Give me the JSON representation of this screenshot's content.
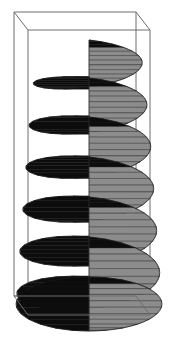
{
  "figure": {
    "title": "Conical helicoid spiral surface in wireframe bounding box",
    "background_color": "#ffffff",
    "width": 176,
    "height": 362,
    "has_text_labels": false,
    "has_axis_tick_labels": false,
    "has_legend": false
  },
  "chart_data": {
    "type": "line",
    "title": "Conical helicoid spiral surface",
    "subtitle": "",
    "xlabel": "",
    "ylabel": "",
    "zlabel": "",
    "plot_style": "3d-surface-mesh",
    "grid": false,
    "legend": "none",
    "axis_ticks_visible": false,
    "projection": "perspective",
    "surface": {
      "name": "conical-helicoid",
      "turns": 7,
      "mesh_lines_per_turn": 26,
      "lit_face_color": "#8c8c8c",
      "shadow_face_color": "#0d0d0d",
      "mesh_line_color": "#2b2b2b",
      "edge_color": "#1a1a1a",
      "radius_top": 0.2,
      "radius_bottom": 1.0,
      "radius_growth": "linear-increasing-downward"
    },
    "bounding_box": {
      "visible": true,
      "color": "#6e6e6e",
      "line_width": 1,
      "style": "wireframe-perspective"
    },
    "series": [
      {
        "name": "spiral-turn-1",
        "index": 1,
        "center_y": 52,
        "radius_x": 52,
        "radius_y": 12,
        "description": "topmost turn, smallest, nearly edge-on"
      },
      {
        "name": "spiral-turn-2",
        "index": 2,
        "center_y": 94,
        "radius_x": 57,
        "radius_y": 16,
        "description": "second turn"
      },
      {
        "name": "spiral-turn-3",
        "index": 3,
        "center_y": 136,
        "radius_x": 61,
        "radius_y": 19,
        "description": "third turn"
      },
      {
        "name": "spiral-turn-4",
        "index": 4,
        "center_y": 178,
        "radius_x": 64,
        "radius_y": 21,
        "description": "fourth turn"
      },
      {
        "name": "spiral-turn-5",
        "index": 5,
        "center_y": 220,
        "radius_x": 67,
        "radius_y": 23,
        "description": "fifth turn"
      },
      {
        "name": "spiral-turn-6",
        "index": 6,
        "center_y": 262,
        "radius_x": 70,
        "radius_y": 25,
        "description": "sixth turn"
      },
      {
        "name": "spiral-turn-7",
        "index": 7,
        "center_y": 304,
        "radius_x": 73,
        "radius_y": 27,
        "description": "bottom turn, largest"
      }
    ],
    "box_vertices": {
      "front_bottom_left": [
        28,
        315
      ],
      "front_bottom_right": [
        150,
        315
      ],
      "front_top_left": [
        28,
        30
      ],
      "front_top_right": [
        150,
        30
      ],
      "back_bottom_left": [
        14,
        296
      ],
      "back_bottom_right": [
        136,
        296
      ],
      "back_top_left": [
        14,
        12
      ],
      "back_top_right": [
        136,
        12
      ]
    }
  }
}
